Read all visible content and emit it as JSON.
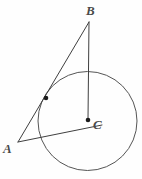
{
  "figure": {
    "background_color": "#fefefe",
    "stroke_color": "#3f3f3f",
    "circle_stroke_color": "#555555",
    "label_color": "#4a4a4a",
    "width": 142,
    "height": 179,
    "labels": {
      "vertex_b": "B",
      "vertex_a": "A",
      "vertex_c": "C"
    },
    "points": {
      "B": {
        "x": 89,
        "y": 22
      },
      "A": {
        "x": 18,
        "y": 142
      },
      "C": {
        "x": 88,
        "y": 120
      },
      "tangent_point": {
        "x": 46,
        "y": 98
      },
      "chord_end": {
        "x": 102,
        "y": 125
      }
    },
    "circle": {
      "cx": 87.5,
      "cy": 121,
      "r": 49.5
    },
    "segments": [
      {
        "name": "segment-AB",
        "x1": 18,
        "y1": 142,
        "x2": 89,
        "y2": 22
      },
      {
        "name": "segment-BC",
        "x1": 89,
        "y1": 22,
        "x2": 88,
        "y2": 120
      },
      {
        "name": "segment-AC",
        "x1": 18,
        "y1": 142,
        "x2": 102,
        "y2": 125
      }
    ],
    "markers": [
      {
        "name": "point-marker-tangent",
        "cx": 46,
        "cy": 98,
        "r": 2.3
      },
      {
        "name": "point-marker-center",
        "cx": 88,
        "cy": 120,
        "r": 2.3
      }
    ]
  }
}
